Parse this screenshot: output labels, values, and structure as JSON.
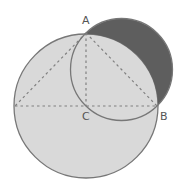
{
  "diagram": {
    "labels": {
      "A": "A",
      "B": "B",
      "C": "C"
    },
    "points": {
      "A": [
        86,
        33
      ],
      "B": [
        157,
        106
      ],
      "C": [
        86,
        106
      ],
      "L": [
        15,
        106
      ]
    },
    "big_circle": {
      "cx": 86,
      "cy": 106,
      "r": 72,
      "fill": "#d9d9d9",
      "stroke": "#777777"
    },
    "small_circle": {
      "cx": 121.5,
      "cy": 69.5,
      "r": 51,
      "stroke": "#777777"
    },
    "lune_fill": "#5e5e5e",
    "dashed_color": "#808080"
  }
}
